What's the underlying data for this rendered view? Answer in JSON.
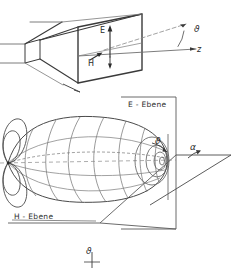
{
  "figure": {
    "language": "de",
    "background_color": "#ffffff",
    "line_color": "#3a3a3a",
    "thin_line_color": "#6e6e6e",
    "text_color": "#2b2b2b"
  },
  "top_diagram": {
    "name": "horn-antenna-perspective",
    "description": "Pyramidal horn antenna drawn in perspective with rectangular aperture, field vectors and z axis",
    "labels": {
      "e_vector": "E",
      "h_vector": "H",
      "z_axis": "z",
      "angle_phi": "ϑ"
    }
  },
  "bottom_diagram": {
    "name": "radiation-pattern-3d",
    "description": "Three dimensional antenna radiation lobe with main lobe, side lobes, E plane and H plane reference planes",
    "labels": {
      "e_plane": "E - Ebene",
      "h_plane": "H - Ebene",
      "angle_phi": "ϑ",
      "angle_alpha": "α"
    }
  },
  "bottom_axis": {
    "name": "phi-axis-marker",
    "label": "ϑ"
  }
}
